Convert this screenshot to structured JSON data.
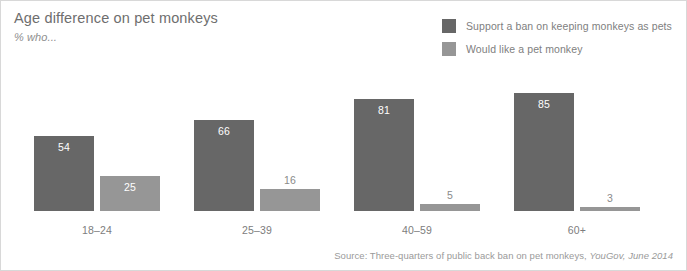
{
  "figure": {
    "width": 687,
    "height": 271,
    "background": "#ffffff",
    "border_color": "#d8d8d8"
  },
  "header": {
    "title": "Age difference on pet monkeys",
    "subtitle": "% who..."
  },
  "source": {
    "prefix": "Source: Three-quarters of public back ban on pet monkeys, ",
    "attribution": "YouGov, June 2014"
  },
  "chart_data": {
    "type": "bar",
    "title": "Age difference on pet monkeys",
    "subtitle": "% who...",
    "xlabel": "",
    "ylabel": "",
    "ylim": [
      0,
      100
    ],
    "grid": false,
    "legend_position": "top-right",
    "categories": [
      "18–24",
      "25–39",
      "40–59",
      "60+"
    ],
    "series": [
      {
        "name": "Support a ban on keeping monkeys as pets",
        "color": "#676767",
        "values": [
          54,
          66,
          81,
          85
        ]
      },
      {
        "name": "Would like a pet monkey",
        "color": "#969696",
        "values": [
          25,
          16,
          5,
          3
        ]
      }
    ],
    "value_labels": {
      "g0s0": "54",
      "g0s1": "25",
      "g1s0": "66",
      "g1s1": "16",
      "g2s0": "81",
      "g2s1": "5",
      "g3s0": "85",
      "g3s1": "3"
    }
  }
}
